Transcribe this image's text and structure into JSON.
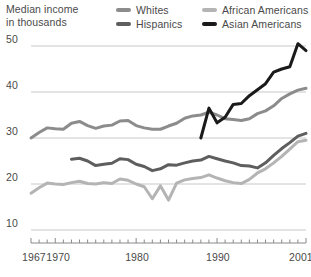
{
  "title": {
    "line1": "Median income",
    "line2": "in thousands"
  },
  "legend": {
    "position": "top-right",
    "items": [
      {
        "label": "Whites",
        "color": "#8c8c8c"
      },
      {
        "label": "Hispanics",
        "color": "#5e5e5e"
      },
      {
        "label": "African Americans",
        "color": "#b4b4b4"
      },
      {
        "label": "Asian Americans",
        "color": "#1a1a1a"
      }
    ]
  },
  "axes": {
    "y_ticks": [
      "50",
      "40",
      "30",
      "20",
      "10"
    ],
    "x_ticks_labeled": [
      "1967",
      "1970",
      "1980",
      "1990",
      "2001"
    ]
  },
  "colors": {
    "gridline": "#c8c8c8",
    "axis": "#8a8a8a",
    "text": "#4a4a4a",
    "background": "#ffffff"
  },
  "chart_data": {
    "type": "line",
    "title": "Median income in thousands",
    "xlabel": "",
    "ylabel": "Median income in thousands",
    "xlim": [
      1967,
      2001
    ],
    "ylim": [
      8,
      53
    ],
    "yticks": [
      10,
      20,
      30,
      40,
      50
    ],
    "xticks_labeled": [
      1967,
      1970,
      1980,
      1990,
      2001
    ],
    "xtick_interval": 1,
    "grid": "horizontal",
    "legend_position": "top-right",
    "series": [
      {
        "name": "Whites",
        "color": "#8c8c8c",
        "x": [
          1967,
          1968,
          1969,
          1970,
          1971,
          1972,
          1973,
          1974,
          1975,
          1976,
          1977,
          1978,
          1979,
          1980,
          1981,
          1982,
          1983,
          1984,
          1985,
          1986,
          1987,
          1988,
          1989,
          1990,
          1991,
          1992,
          1993,
          1994,
          1995,
          1996,
          1997,
          1998,
          1999,
          2000,
          2001
        ],
        "values": [
          30.0,
          31.2,
          32.2,
          32.0,
          31.9,
          33.2,
          33.6,
          32.7,
          32.1,
          32.6,
          32.8,
          33.7,
          33.8,
          32.7,
          32.2,
          31.9,
          31.9,
          32.6,
          33.2,
          34.3,
          34.8,
          35.0,
          35.6,
          35.0,
          34.2,
          34.0,
          33.8,
          34.2,
          35.3,
          35.9,
          37.0,
          38.6,
          39.6,
          40.4,
          40.8
        ]
      },
      {
        "name": "Hispanics",
        "color": "#5e5e5e",
        "x": [
          1972,
          1973,
          1974,
          1975,
          1976,
          1977,
          1978,
          1979,
          1980,
          1981,
          1982,
          1983,
          1984,
          1985,
          1986,
          1987,
          1988,
          1989,
          1990,
          1991,
          1992,
          1993,
          1994,
          1995,
          1996,
          1997,
          1998,
          1999,
          2000,
          2001
        ],
        "values": [
          25.4,
          25.6,
          25.0,
          24.0,
          24.3,
          24.5,
          25.5,
          25.3,
          24.3,
          23.8,
          22.9,
          23.3,
          24.2,
          24.1,
          24.6,
          25.0,
          25.2,
          26.0,
          25.5,
          25.0,
          24.6,
          24.0,
          23.9,
          23.5,
          24.6,
          26.2,
          27.7,
          29.0,
          30.4,
          31.0
        ]
      },
      {
        "name": "African Americans",
        "color": "#b4b4b4",
        "x": [
          1967,
          1968,
          1969,
          1970,
          1971,
          1972,
          1973,
          1974,
          1975,
          1976,
          1977,
          1978,
          1979,
          1980,
          1981,
          1982,
          1983,
          1984,
          1985,
          1986,
          1987,
          1988,
          1989,
          1990,
          1991,
          1992,
          1993,
          1994,
          1995,
          1996,
          1997,
          1998,
          1999,
          2000,
          2001
        ],
        "values": [
          18.0,
          19.2,
          20.2,
          20.0,
          19.9,
          20.3,
          20.6,
          20.1,
          20.0,
          20.3,
          20.1,
          21.1,
          20.8,
          20.0,
          19.4,
          16.8,
          19.6,
          16.5,
          20.2,
          20.9,
          21.2,
          21.4,
          22.0,
          21.3,
          20.7,
          20.3,
          20.1,
          21.0,
          22.4,
          23.3,
          24.6,
          26.0,
          27.6,
          29.2,
          29.5
        ]
      },
      {
        "name": "Asian Americans",
        "color": "#1a1a1a",
        "x": [
          1988,
          1989,
          1990,
          1991,
          1992,
          1993,
          1994,
          1995,
          1996,
          1997,
          1998,
          1999,
          2000,
          2001
        ],
        "values": [
          30.0,
          36.5,
          33.3,
          34.5,
          37.3,
          37.5,
          39.2,
          40.5,
          41.8,
          44.3,
          45.0,
          45.5,
          50.5,
          49.0
        ]
      }
    ]
  }
}
